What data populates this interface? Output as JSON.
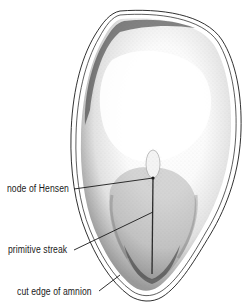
{
  "figure": {
    "colors": {
      "ink": "#1a1a1a",
      "stipple_dark": "#2b2b2b",
      "background": "#ffffff"
    }
  },
  "labels": [
    {
      "id": "node-of-hensen",
      "text": "node of Hensen"
    },
    {
      "id": "primitive-streak",
      "text": "primitive streak"
    },
    {
      "id": "cut-edge-of-amnion",
      "text": "cut edge of amnion"
    }
  ]
}
